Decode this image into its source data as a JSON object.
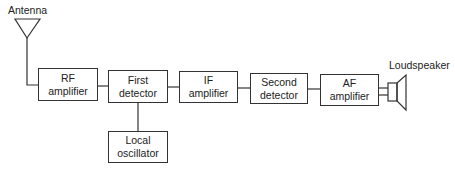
{
  "diagram": {
    "antenna": {
      "label": "Antenna"
    },
    "loudspeaker": {
      "label": "Loudspeaker"
    },
    "blocks": [
      {
        "id": "rf",
        "line1": "RF",
        "line2": "amplifier"
      },
      {
        "id": "first-detector",
        "line1": "First",
        "line2": "detector"
      },
      {
        "id": "if",
        "line1": "IF",
        "line2": "amplifier"
      },
      {
        "id": "second-detector",
        "line1": "Second",
        "line2": "detector"
      },
      {
        "id": "af",
        "line1": "AF",
        "line2": "amplifier"
      },
      {
        "id": "local-oscillator",
        "line1": "Local",
        "line2": "oscillator"
      }
    ],
    "connections": [
      [
        "antenna",
        "rf"
      ],
      [
        "rf",
        "first-detector"
      ],
      [
        "first-detector",
        "if"
      ],
      [
        "if",
        "second-detector"
      ],
      [
        "second-detector",
        "af"
      ],
      [
        "af",
        "loudspeaker"
      ],
      [
        "local-oscillator",
        "first-detector"
      ]
    ],
    "colors": {
      "line": "#333333",
      "background": "#ffffff"
    }
  }
}
